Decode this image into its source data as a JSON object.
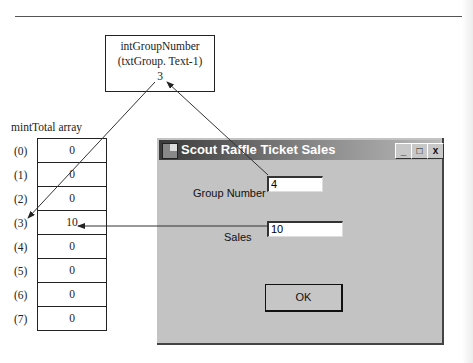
{
  "variable_box": {
    "name": "intGroupNumber",
    "expression": "(txtGroup. Text-1)",
    "value": "3"
  },
  "array": {
    "title": "mintTotal array",
    "rows": [
      {
        "index": "(0)",
        "value": "0"
      },
      {
        "index": "(1)",
        "value": "0"
      },
      {
        "index": "(2)",
        "value": "0"
      },
      {
        "index": "(3)",
        "value": "10"
      },
      {
        "index": "(4)",
        "value": "0"
      },
      {
        "index": "(5)",
        "value": "0"
      },
      {
        "index": "(6)",
        "value": "0"
      },
      {
        "index": "(7)",
        "value": "0"
      }
    ]
  },
  "dialog": {
    "title": "Scout Raffle Ticket Sales",
    "titlebar_buttons": {
      "minimize": "_",
      "maximize": "□",
      "close": "x"
    },
    "group_number_label": "Group Number",
    "group_number_value": "4",
    "sales_label": "Sales",
    "sales_value": "10",
    "ok_label": "OK"
  }
}
